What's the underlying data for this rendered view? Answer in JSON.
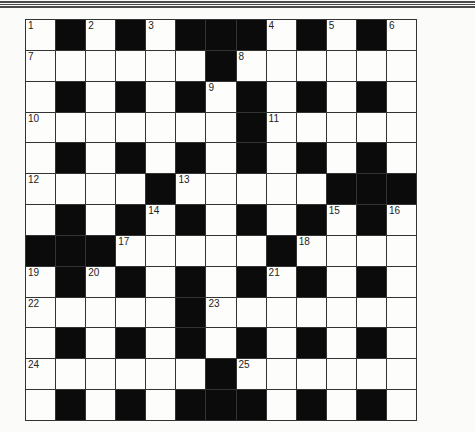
{
  "puzzle": {
    "type": "crossword",
    "rows": 13,
    "cols": 13,
    "colors": {
      "black": "#0b0b0b",
      "white": "#fdfdfc",
      "grid_line": "#333333"
    },
    "layout": [
      "W#W#W###W#W#W",
      "WWWWWW#WWWWWW",
      "W#W#W#W#W#W#W",
      "WWWWWWW#WWWWW",
      "W#W#W#W#W#W#W",
      "WWWW#WWWWW###",
      "W#W#W#W#W#W#W",
      "###WWWWW#WWWW",
      "W#W#W#W#W#W#W",
      "WWWWW#WWWWWWW",
      "W#W#W#W#W#W#W",
      "WWWWWW#WWWWWW",
      "W#W#W###W#W#W"
    ],
    "numbers": [
      {
        "r": 0,
        "c": 0,
        "n": "1"
      },
      {
        "r": 0,
        "c": 2,
        "n": "2"
      },
      {
        "r": 0,
        "c": 4,
        "n": "3"
      },
      {
        "r": 0,
        "c": 8,
        "n": "4"
      },
      {
        "r": 0,
        "c": 10,
        "n": "5"
      },
      {
        "r": 0,
        "c": 12,
        "n": "6"
      },
      {
        "r": 1,
        "c": 0,
        "n": "7"
      },
      {
        "r": 1,
        "c": 7,
        "n": "8"
      },
      {
        "r": 2,
        "c": 6,
        "n": "9"
      },
      {
        "r": 3,
        "c": 0,
        "n": "10"
      },
      {
        "r": 3,
        "c": 8,
        "n": "11"
      },
      {
        "r": 5,
        "c": 0,
        "n": "12"
      },
      {
        "r": 5,
        "c": 5,
        "n": "13"
      },
      {
        "r": 6,
        "c": 4,
        "n": "14"
      },
      {
        "r": 6,
        "c": 10,
        "n": "15"
      },
      {
        "r": 6,
        "c": 12,
        "n": "16"
      },
      {
        "r": 7,
        "c": 3,
        "n": "17"
      },
      {
        "r": 7,
        "c": 9,
        "n": "18"
      },
      {
        "r": 8,
        "c": 0,
        "n": "19"
      },
      {
        "r": 8,
        "c": 2,
        "n": "20"
      },
      {
        "r": 8,
        "c": 8,
        "n": "21"
      },
      {
        "r": 9,
        "c": 0,
        "n": "22"
      },
      {
        "r": 9,
        "c": 6,
        "n": "23"
      },
      {
        "r": 11,
        "c": 0,
        "n": "24"
      },
      {
        "r": 11,
        "c": 7,
        "n": "25"
      }
    ]
  }
}
